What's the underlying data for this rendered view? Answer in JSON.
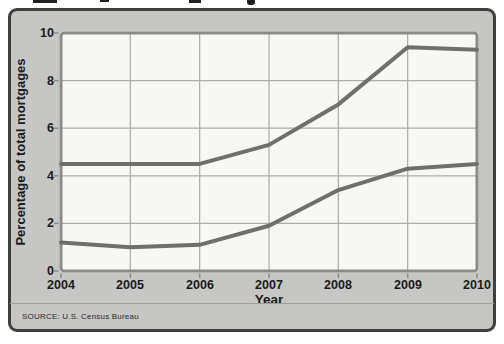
{
  "page": {
    "source_note": "SOURCE: U.S. Census Bureau"
  },
  "chart_data": {
    "type": "line",
    "x": [
      2004,
      2005,
      2006,
      2007,
      2008,
      2009,
      2010
    ],
    "series": [
      {
        "name": "upper-line",
        "values": [
          4.5,
          4.5,
          4.5,
          5.3,
          7.0,
          9.4,
          9.3
        ]
      },
      {
        "name": "lower-line",
        "values": [
          1.2,
          1.0,
          1.1,
          1.9,
          3.4,
          4.3,
          4.5
        ]
      }
    ],
    "xlabel": "Year",
    "ylabel": "Percentage of total mortgages",
    "ylim": [
      0,
      10
    ],
    "y_ticks": [
      0,
      2,
      4,
      6,
      8,
      10
    ],
    "y_tick_labels_top_to_bottom": [
      "10",
      "8",
      "6",
      "4",
      "2",
      "0"
    ],
    "grid": true,
    "legend": "none"
  },
  "style": {
    "panel_bg": "#c6c6c4",
    "panel_border": "#3f3f3d",
    "plot_bg": "#f7f7f3",
    "plot_border": "#8b8b89",
    "grid_color": "#ababa9",
    "line_color": "#6f6f6d",
    "text_color": "#1b1b19"
  }
}
